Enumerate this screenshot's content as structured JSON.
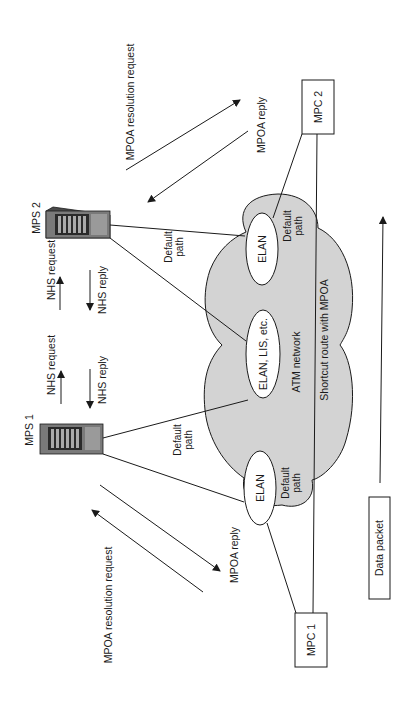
{
  "diagram": {
    "orientation": "rotated 90deg counter-clockwise",
    "colors": {
      "cloud_fill": "#d3d3d3",
      "stroke": "#1a1a1a",
      "server_body": "#6e6e6e",
      "background": "#ffffff"
    },
    "network": {
      "label": "ATM network",
      "shortcut_label": "Shortcut route with MPOA"
    },
    "lans": [
      {
        "id": "elan-top",
        "label": "ELAN"
      },
      {
        "id": "elan-middle",
        "label": "ELAN, LIS, etc."
      },
      {
        "id": "elan-bottom",
        "label": "ELAN"
      }
    ],
    "servers": [
      {
        "id": "mps2",
        "label": "MPS 2",
        "icon": "server-icon"
      },
      {
        "id": "mps1",
        "label": "MPS 1",
        "icon": "server-icon"
      }
    ],
    "clients": [
      {
        "id": "mpc2",
        "label": "MPC 2"
      },
      {
        "id": "mpc1",
        "label": "MPC 1"
      }
    ],
    "default_path_labels": {
      "mps2": [
        "Default",
        "path"
      ],
      "mps1": [
        "Default",
        "path"
      ],
      "elan_top": [
        "Default",
        "path"
      ],
      "elan_bottom": [
        "Default",
        "path"
      ]
    },
    "messages": {
      "mpoa_request_top": "MPOA resolution request",
      "mpoa_reply_top": "MPOA reply",
      "mpoa_request_bottom": "MPOA resolution request",
      "mpoa_reply_bottom": "MPOA reply",
      "nhs_request_1": "NHS request",
      "nhs_reply_1": "NHS reply",
      "nhs_request_2": "NHS request",
      "nhs_reply_2": "NHS reply"
    },
    "data_packet": {
      "label": "Data packet"
    }
  }
}
